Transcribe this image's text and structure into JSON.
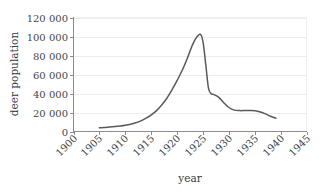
{
  "chart_data": {
    "type": "line",
    "title": "",
    "xlabel": "year",
    "ylabel": "deer population",
    "xlim": [
      1900,
      1945
    ],
    "ylim": [
      0,
      120000
    ],
    "grid": "horizontal",
    "legend": "none",
    "x_ticks": [
      "1900",
      "1905",
      "1910",
      "1915",
      "1920",
      "1925",
      "1930",
      "1935",
      "1940",
      "1945"
    ],
    "x_tick_values": [
      1900,
      1905,
      1910,
      1915,
      1920,
      1925,
      1930,
      1935,
      1940,
      1945
    ],
    "y_ticks": [
      "0",
      "20 000",
      "40 000",
      "60 000",
      "80 000",
      "100 000",
      "120 000"
    ],
    "y_tick_values": [
      0,
      20000,
      40000,
      60000,
      80000,
      100000,
      120000
    ],
    "series": [
      {
        "name": "deer population",
        "color": "#595959",
        "x": [
          1905,
          1906,
          1907,
          1908,
          1909,
          1910,
          1911,
          1912,
          1913,
          1914,
          1915,
          1916,
          1917,
          1918,
          1919,
          1920,
          1921,
          1922,
          1923,
          1924,
          1924.6,
          1925,
          1925.5,
          1926,
          1926.5,
          1927,
          1928,
          1929,
          1930,
          1931,
          1932,
          1933,
          1934,
          1935,
          1936,
          1937,
          1938,
          1939
        ],
        "y": [
          4000,
          4300,
          4700,
          5200,
          5800,
          6600,
          7700,
          9200,
          11200,
          14000,
          17500,
          22000,
          28000,
          35000,
          44000,
          54000,
          65000,
          78000,
          92000,
          101000,
          101500,
          93000,
          70000,
          46000,
          40000,
          39000,
          36000,
          30000,
          25000,
          22500,
          22000,
          22000,
          22000,
          21800,
          20500,
          18500,
          16000,
          14000
        ]
      }
    ],
    "annotations": {
      "peak_year": 1924,
      "peak_value": 101500,
      "start_year": 1905,
      "start_value": 4000,
      "end_year": 1939,
      "end_value": 14000
    }
  },
  "colors": {
    "curve": "#595959",
    "gridline": "#ececec",
    "axis": "#8c8c8c",
    "text": "#3a3a3a",
    "background": "#ffffff"
  }
}
